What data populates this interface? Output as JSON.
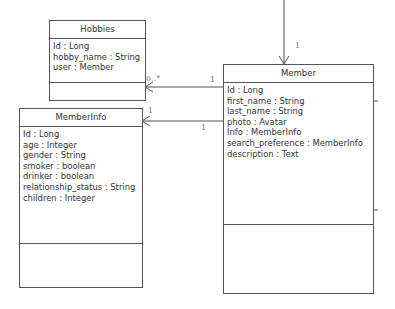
{
  "diagram": {
    "type": "uml-class-diagram",
    "classes": [
      {
        "name": "Hobbies",
        "attributes": [
          "Id : Long",
          "hobby_name : String",
          "user : Member"
        ],
        "operations": []
      },
      {
        "name": "Member",
        "attributes": [
          "Id : Long",
          "first_name : String",
          "last_name : String",
          "photo : Avatar",
          "Info : MemberInfo",
          "search_preference : MemberInfo",
          "description : Text"
        ],
        "operations": []
      },
      {
        "name": "MemberInfo",
        "attributes": [
          "Id : Long",
          "age : Integer",
          "gender : String",
          "smoker : boolean",
          "drinker : boolean",
          "relationship_status : String",
          "children : Integer"
        ],
        "operations": []
      }
    ],
    "associations": [
      {
        "from": "(external, top)",
        "to": "Member",
        "target_multiplicity": "1"
      },
      {
        "from": "Member",
        "to": "Hobbies",
        "source_multiplicity": "1",
        "target_multiplicity": "0..*"
      },
      {
        "from": "Member",
        "to": "MemberInfo",
        "source_multiplicity": "1",
        "target_multiplicity": "1"
      }
    ],
    "colors": {
      "line": "#555555",
      "text": "#333333",
      "multiplicity": "#777777"
    }
  }
}
